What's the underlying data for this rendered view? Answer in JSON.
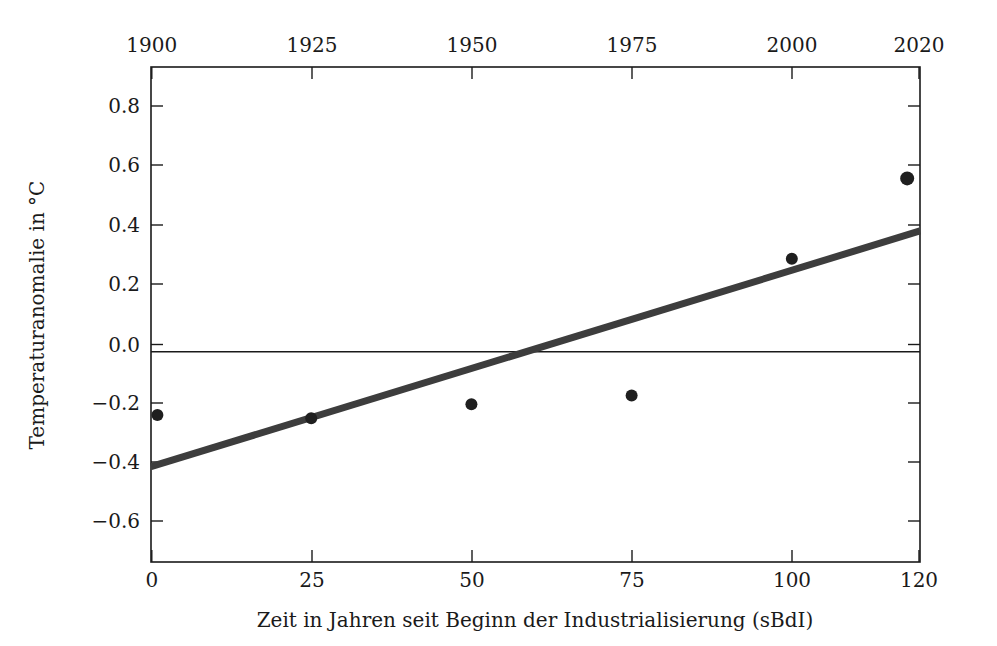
{
  "chart_data": {
    "type": "scatter",
    "title": "",
    "xlabel": "Zeit in Jahren seit Beginn der Industrialisierung (sBdI)",
    "ylabel": "Temperaturanomalie in °C",
    "xlim": [
      0,
      120
    ],
    "ylim": [
      -0.68,
      0.92
    ],
    "grid": false,
    "legend": null,
    "x_ticks": [
      0,
      25,
      50,
      75,
      100,
      120
    ],
    "x_tick_labels": [
      "0",
      "25",
      "50",
      "75",
      "100",
      "120"
    ],
    "x_ticks_top": [
      0,
      25,
      50,
      75,
      100,
      120
    ],
    "x_tick_labels_top": [
      "1900",
      "1925",
      "1950",
      "1975",
      "2000",
      "2020"
    ],
    "y_ticks": [
      -0.6,
      -0.4,
      -0.2,
      0.0,
      0.2,
      0.4,
      0.6,
      0.8
    ],
    "y_tick_labels": [
      "−0.6",
      "−0.4",
      "−0.2",
      "0.0",
      "0.2",
      "0.4",
      "0.6",
      "0.8"
    ],
    "series": [
      {
        "name": "Temperaturanomalie (Messpunkte)",
        "type": "scatter",
        "marker_color": "#1f1f1f",
        "points": [
          {
            "x": 1,
            "y": -0.205
          },
          {
            "x": 25,
            "y": -0.215
          },
          {
            "x": 50,
            "y": -0.17
          },
          {
            "x": 75,
            "y": -0.142
          },
          {
            "x": 100,
            "y": 0.3
          },
          {
            "x": 118,
            "y": 0.56
          }
        ]
      },
      {
        "name": "Ausgleichsgerade",
        "type": "line",
        "line_color": "#3d3d3d",
        "points": [
          {
            "x": 0,
            "y": -0.372
          },
          {
            "x": 120,
            "y": 0.39
          }
        ],
        "slope_per_year": 0.00635,
        "intercept": -0.372,
        "zero_crossing_x": 58.6
      }
    ],
    "zero_reference_line": {
      "y": 0.0,
      "color": "#1a1a1a"
    }
  }
}
